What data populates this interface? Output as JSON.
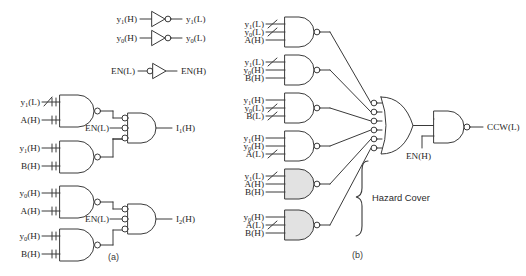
{
  "figure": {
    "panel_a_caption": "(a)",
    "panel_b_caption": "(b)",
    "hazard_cover_label": "Hazard Cover",
    "line_color": "#3a3a3a",
    "shaded_gate_fill": "#e2e2e2",
    "background": "#ffffff"
  },
  "panel_a": {
    "inverters": [
      {
        "input": "y1(H)",
        "input_html": "y<sub>1</sub>(H)",
        "output": "y1(L)",
        "output_html": "y<sub>1</sub>(L)",
        "bubble": "output"
      },
      {
        "input": "y0(H)",
        "input_html": "y<sub>0</sub>(H)",
        "output": "y0(L)",
        "output_html": "y<sub>0</sub>(L)",
        "bubble": "output"
      },
      {
        "input": "EN(L)",
        "input_html": "EN(L)",
        "output": "EN(H)",
        "output_html": "EN(H)",
        "bubble": "input"
      }
    ],
    "gates": [
      {
        "id": "a-nand-1",
        "type": "nand",
        "inputs": [
          "y1(L)",
          "A(H)"
        ],
        "inputs_html": [
          "y<sub>1</sub>(L)",
          "A(H)"
        ],
        "hazard_slash": [
          true,
          false
        ]
      },
      {
        "id": "a-nand-2",
        "type": "nand",
        "inputs": [
          "y1(H)",
          "B(H)"
        ],
        "inputs_html": [
          "y<sub>1</sub>(H)",
          "B(H)"
        ],
        "hazard_slash": [
          false,
          false
        ]
      },
      {
        "id": "a-nand-3",
        "type": "nand",
        "inputs": [
          "y0(H)",
          "A(H)"
        ],
        "inputs_html": [
          "y<sub>0</sub>(H)",
          "A(H)"
        ],
        "hazard_slash": [
          false,
          false
        ]
      },
      {
        "id": "a-nand-4",
        "type": "nand",
        "inputs": [
          "y0(H)",
          "B(H)"
        ],
        "inputs_html": [
          "y<sub>0</sub>(H)",
          "B(H)"
        ],
        "hazard_slash": [
          false,
          false
        ]
      }
    ],
    "merge_gates": [
      {
        "id": "a-out-1",
        "type": "nand-3in-bubbled",
        "enable": "EN(L)",
        "output": "I1(H)",
        "output_html": "I<sub>1</sub>(H)"
      },
      {
        "id": "a-out-2",
        "type": "nand-3in-bubbled",
        "enable": "EN(L)",
        "output": "I2(H)",
        "output_html": "I<sub>2</sub>(H)"
      }
    ]
  },
  "panel_b": {
    "gates": [
      {
        "id": "b-nand-1",
        "type": "nand",
        "shaded": false,
        "inputs": [
          "y1(L)",
          "y0(L)",
          "A(H)"
        ],
        "inputs_html": [
          "y<sub>1</sub>(L)",
          "y<sub>0</sub>(L)",
          "A(H)"
        ],
        "hazard_slash": [
          true,
          true,
          false
        ]
      },
      {
        "id": "b-nand-2",
        "type": "nand",
        "shaded": false,
        "inputs": [
          "y1(L)",
          "y0(H)",
          "B(H)"
        ],
        "inputs_html": [
          "y<sub>1</sub>(L)",
          "y<sub>0</sub>(H)",
          "B(H)"
        ],
        "hazard_slash": [
          true,
          false,
          false
        ]
      },
      {
        "id": "b-nand-3",
        "type": "nand",
        "shaded": false,
        "inputs": [
          "y1(H)",
          "y0(L)",
          "B(L)"
        ],
        "inputs_html": [
          "y<sub>1</sub>(H)",
          "y<sub>0</sub>(L)",
          "B(L)"
        ],
        "hazard_slash": [
          false,
          true,
          true
        ]
      },
      {
        "id": "b-nand-4",
        "type": "nand",
        "shaded": false,
        "inputs": [
          "y1(H)",
          "y0(H)",
          "A(L)"
        ],
        "inputs_html": [
          "y<sub>1</sub>(H)",
          "y<sub>0</sub>(H)",
          "A(L)"
        ],
        "hazard_slash": [
          false,
          false,
          true
        ]
      },
      {
        "id": "b-nand-5",
        "type": "nand",
        "shaded": true,
        "inputs": [
          "y1(L)",
          "A(H)",
          "B(H)"
        ],
        "inputs_html": [
          "y<sub>1</sub>(L)",
          "A(H)",
          "B(H)"
        ],
        "hazard_slash": [
          true,
          false,
          false
        ]
      },
      {
        "id": "b-nand-6",
        "type": "nand",
        "shaded": true,
        "inputs": [
          "y0(H)",
          "A(L)",
          "B(H)"
        ],
        "inputs_html": [
          "y<sub>0</sub>(H)",
          "A(L)",
          "B(H)"
        ],
        "hazard_slash": [
          false,
          true,
          false
        ]
      }
    ],
    "or_gate": {
      "id": "b-or",
      "type": "or-6in-bubbled",
      "input_count": 6
    },
    "output_gate": {
      "id": "b-out-nand",
      "type": "nand",
      "enable": "EN(H)",
      "output": "CCW(L)"
    }
  }
}
